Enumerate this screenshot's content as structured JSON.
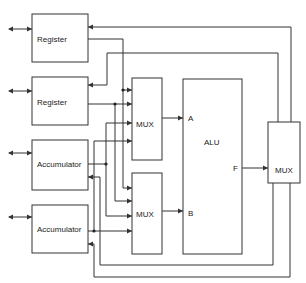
{
  "diagram": {
    "type": "block-diagram",
    "blocks": {
      "register1": {
        "label": "Register"
      },
      "register2": {
        "label": "Register"
      },
      "accumulator1": {
        "label": "Accumulator"
      },
      "accumulator2": {
        "label": "Accumulator"
      },
      "mux_a": {
        "label": "MUX"
      },
      "mux_b": {
        "label": "MUX"
      },
      "alu": {
        "label": "ALU",
        "port_a": "A",
        "port_b": "B",
        "port_f": "F"
      },
      "mux_out": {
        "label": "MUX"
      }
    },
    "colors": {
      "line": "#333333",
      "background": "#ffffff"
    }
  }
}
